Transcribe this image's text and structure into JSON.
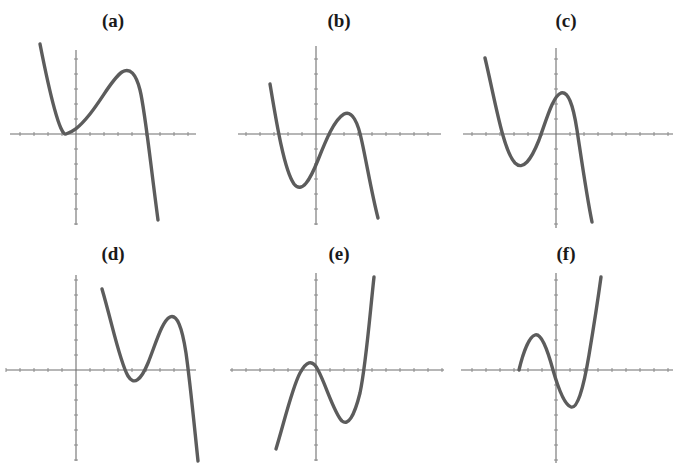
{
  "figure": {
    "title": "",
    "background_color": "#ffffff",
    "curve_color": "#5c5c5c",
    "axis_color": "#6f6f6f",
    "tick_color": "#8a8a8a",
    "columns": 3,
    "rows": 2,
    "panel_width": 226,
    "panel_height": 233
  },
  "panels": [
    {
      "id": "a",
      "label": "(a)",
      "origin_x": 0,
      "origin_y": 0,
      "axis_origin": {
        "x": 76,
        "y": 134
      },
      "x_axis_span": [
        10,
        196
      ],
      "y_axis_span": [
        50,
        225
      ],
      "curve_path": "M 40,44 C 50,95 60,136 66,134 C 72,132 78,129 90,114 C 104,96 112,79 122,72 C 130,67 136,74 140,90 C 145,110 150,160 158,220",
      "description": "cubic with local minimum touching x-axis left of y-axis, local maximum above axis, falling steeply to the right"
    },
    {
      "id": "b",
      "label": "(b)",
      "origin_x": 226,
      "origin_y": 0,
      "axis_origin": {
        "x": 90,
        "y": 134
      },
      "x_axis_span": [
        12,
        215
      ],
      "y_axis_span": [
        46,
        225
      ],
      "curve_path": "M 44,84 C 50,120 58,170 68,184 C 76,194 84,180 92,160 C 100,140 108,120 118,114 C 126,110 132,122 136,142 C 141,165 146,195 152,218",
      "description": "cubic shifted down, minimum below axis left of y-axis, maximum above axis right of y-axis"
    },
    {
      "id": "c",
      "label": "(c)",
      "origin_x": 453,
      "origin_y": 0,
      "axis_origin": {
        "x": 103,
        "y": 134
      },
      "x_axis_span": [
        10,
        220
      ],
      "y_axis_span": [
        48,
        228
      ],
      "curve_path": "M 32,58 C 42,100 50,150 62,163 C 70,171 78,160 86,140 C 94,118 100,96 108,93 C 115,91 120,104 124,130 C 129,163 134,198 139,222",
      "description": "cubic with minimum below axis, maximum just right of y-axis slightly above it, steep fall"
    },
    {
      "id": "d",
      "label": "(d)",
      "origin_x": 0,
      "origin_y": 233,
      "axis_origin": {
        "x": 76,
        "y": 137
      },
      "x_axis_span": [
        6,
        196
      ],
      "y_axis_span": [
        42,
        228
      ],
      "curve_path": "M 102,56 C 112,90 120,130 128,143 C 134,153 141,147 148,130 C 156,110 162,88 170,84 C 177,81 182,94 186,120 C 190,148 194,190 198,228",
      "description": "cubic entirely right of y-axis, minimum below axis, maximum above axis, steep fall off bottom"
    },
    {
      "id": "e",
      "label": "(e)",
      "origin_x": 226,
      "origin_y": 233,
      "axis_origin": {
        "x": 90,
        "y": 137
      },
      "x_axis_span": [
        4,
        218
      ],
      "y_axis_span": [
        40,
        228
      ],
      "curve_path": "M 50,216 C 58,190 66,155 74,140 C 80,129 86,125 92,137 C 100,152 108,180 116,188 C 122,193 128,184 134,160 C 140,132 144,80 148,44",
      "description": "cubic rising overall, maximum above axis left of y-axis, minimum below axis right of y-axis, steep rise"
    },
    {
      "id": "f",
      "label": "(f)",
      "origin_x": 453,
      "origin_y": 233,
      "axis_origin": {
        "x": 103,
        "y": 137
      },
      "x_axis_span": [
        8,
        220
      ],
      "y_axis_span": [
        40,
        230
      ],
      "curve_path": "M 66,137 C 70,120 76,104 82,102 C 88,100 94,115 100,137 C 106,158 112,172 118,174 C 124,176 130,158 136,122 C 141,92 145,66 148,44",
      "description": "cubic starting on x-axis, maximum above axis, minimum below axis, steep rise on the right"
    }
  ],
  "axis_ticks": {
    "x_tick_spacing": 14,
    "y_tick_spacing": 15,
    "tick_length": 4
  }
}
